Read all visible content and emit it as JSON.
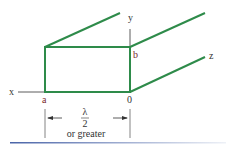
{
  "diagram": {
    "title": "",
    "type": "rectangular-waveguide",
    "colors": {
      "waveguide": "#2e8b4a",
      "axis": "#333333",
      "label": "#333333",
      "corner_label": "#7a2a2a",
      "rule_start": "#4a64a8",
      "rule_end": "#e8ecf4"
    },
    "labels": {
      "x_axis": "x",
      "y_axis": "y",
      "z_axis": "z",
      "corner_a": "a",
      "corner_b": "b",
      "origin": "0",
      "width_symbol": "λ",
      "width_denominator": "2",
      "width_note": "or greater"
    }
  }
}
